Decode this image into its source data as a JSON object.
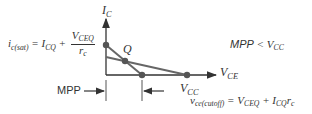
{
  "axes": {
    "y_label": "I",
    "y_sub": "C",
    "x_label": "V",
    "x_sub": "CE"
  },
  "points": {
    "q_label": "Q",
    "vcc_label": "V",
    "vcc_sub": "CC"
  },
  "equations": {
    "sat_lhs": "i",
    "sat_lhs_sub": "c(sat)",
    "sat_eq": " = I",
    "sat_icq_sub": "CQ",
    "sat_plus": " + ",
    "sat_num": "V",
    "sat_num_sub": "CEQ",
    "sat_den": "r",
    "sat_den_sub": "c",
    "cut_lhs": "v",
    "cut_lhs_sub": "ce(cutoff)",
    "cut_eq": " = V",
    "cut_vceq_sub": "CEQ",
    "cut_plus": " + I",
    "cut_icq_sub": "CQ",
    "cut_r": "r",
    "cut_r_sub": "c"
  },
  "annotation": {
    "mpp_label": "MPP",
    "relation_lhs": "MPP",
    "relation_op": " < ",
    "relation_rhs": "V",
    "relation_rhs_sub": "CC"
  },
  "colors": {
    "line": "#666666",
    "point": "#555555",
    "text": "#333333"
  }
}
